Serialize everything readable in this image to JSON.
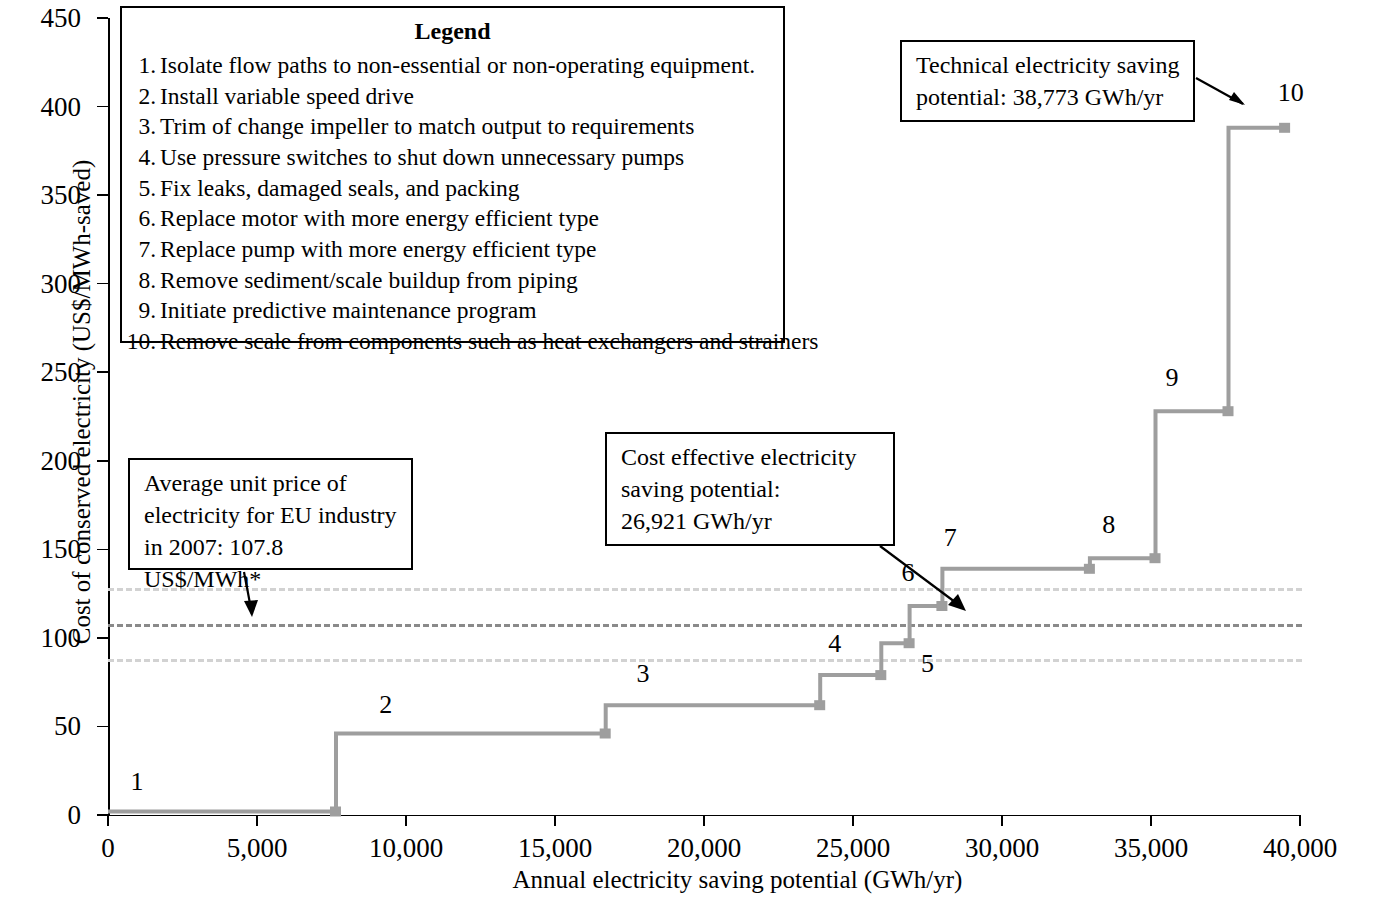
{
  "chart_data": {
    "type": "line",
    "title": "",
    "xlabel": "Annual electricity saving potential (GWh/yr)",
    "ylabel": "Cost of conserved electricity (US$/MWh-saved)",
    "xlim": [
      0,
      40000
    ],
    "ylim": [
      0,
      450
    ],
    "xticks": [
      "0",
      "5,000",
      "10,000",
      "15,000",
      "20,000",
      "25,000",
      "30,000",
      "35,000",
      "40,000"
    ],
    "xtick_values": [
      0,
      5000,
      10000,
      15000,
      20000,
      25000,
      30000,
      35000,
      40000
    ],
    "yticks": [
      "0",
      "50",
      "100",
      "150",
      "200",
      "250",
      "300",
      "350",
      "400",
      "450"
    ],
    "ytick_values": [
      0,
      50,
      100,
      150,
      200,
      250,
      300,
      350,
      400,
      450
    ],
    "grid": false,
    "legend_position": "inside-top",
    "series_name": "Cost of conserved electricity supply curve",
    "series_color": "#9e9e9e",
    "steps": [
      {
        "id": 1,
        "x_start": 0,
        "x_end": 7650,
        "cost": 2,
        "label": "1"
      },
      {
        "id": 2,
        "x_start": 7650,
        "x_end": 16700,
        "cost": 46,
        "label": "2"
      },
      {
        "id": 3,
        "x_start": 16700,
        "x_end": 23900,
        "cost": 62,
        "label": "3"
      },
      {
        "id": 4,
        "x_start": 23900,
        "x_end": 25950,
        "cost": 79,
        "label": "4"
      },
      {
        "id": 5,
        "x_start": 25950,
        "x_end": 26900,
        "cost": 97,
        "label": "5"
      },
      {
        "id": 6,
        "x_start": 26900,
        "x_end": 28000,
        "cost": 118,
        "label": "6"
      },
      {
        "id": 7,
        "x_start": 28000,
        "x_end": 32950,
        "cost": 139,
        "label": "7"
      },
      {
        "id": 8,
        "x_start": 32950,
        "x_end": 35150,
        "cost": 145,
        "label": "8"
      },
      {
        "id": 9,
        "x_start": 35150,
        "x_end": 37600,
        "cost": 228,
        "label": "9"
      },
      {
        "id": 10,
        "x_start": 37600,
        "x_end": 39500,
        "cost": 388,
        "label": "10"
      }
    ],
    "reference_lines": [
      {
        "name": "upper-band",
        "value": 128,
        "style": "dashed",
        "color": "#d2d2d2"
      },
      {
        "name": "average-unit-price",
        "value": 107.8,
        "style": "dashed",
        "color": "#8a8a8a"
      },
      {
        "name": "lower-band",
        "value": 88,
        "style": "dashed",
        "color": "#d2d2d2"
      }
    ],
    "annotations": [
      {
        "name": "technical-potential",
        "text": "Technical electricity saving potential: 38,773 GWh/yr",
        "value": 38773,
        "unit": "GWh/yr"
      },
      {
        "name": "cost-effective-potential",
        "text": "Cost effective electricity saving potential: 26,921 GWh/yr",
        "value": 26921,
        "unit": "GWh/yr"
      },
      {
        "name": "average-price",
        "text": "Average unit price of electricity for EU industry in 2007: 107.8 US$/MWh*",
        "value": 107.8,
        "unit": "US$/MWh"
      }
    ]
  },
  "axes": {
    "y_title": "Cost of conserved electricity (US$/MWh-saved)",
    "x_title": "Annual electricity saving potential (GWh/yr)",
    "y_ticks": [
      "450",
      "400",
      "350",
      "300",
      "250",
      "200",
      "150",
      "100",
      "50",
      "0"
    ],
    "x_ticks": [
      "0",
      "5,000",
      "10,000",
      "15,000",
      "20,000",
      "25,000",
      "30,000",
      "35,000",
      "40,000"
    ]
  },
  "legend": {
    "title": "Legend",
    "items": [
      {
        "num": "1.",
        "text": "Isolate flow paths to non-essential or non-operating equipment."
      },
      {
        "num": "2.",
        "text": "Install variable speed drive"
      },
      {
        "num": "3.",
        "text": "Trim of change impeller to match output to requirements"
      },
      {
        "num": "4.",
        "text": "Use pressure switches to shut down unnecessary pumps"
      },
      {
        "num": "5.",
        "text": "Fix leaks, damaged seals, and packing"
      },
      {
        "num": "6.",
        "text": "Replace motor with more energy efficient type"
      },
      {
        "num": "7.",
        "text": "Replace pump with more energy efficient type"
      },
      {
        "num": "8.",
        "text": "Remove sediment/scale buildup from piping"
      },
      {
        "num": "9.",
        "text": "Initiate predictive maintenance program"
      },
      {
        "num": "10.",
        "text": "Remove scale from components such as heat exchangers and strainers"
      }
    ]
  },
  "callouts": {
    "technical": {
      "line1": "Technical electricity  saving",
      "line2": "potential: 38,773 GWh/yr"
    },
    "cost_effective": {
      "line1": "Cost effective  electricity",
      "line2": "saving potential:",
      "line3": "26,921 GWh/yr"
    },
    "average_price": {
      "line1": "Average unit price of",
      "line2": "electricity for EU industry",
      "line3": "in 2007: 107.8 US$/MWh*"
    }
  },
  "point_labels": [
    "1",
    "2",
    "3",
    "4",
    "5",
    "6",
    "7",
    "8",
    "9",
    "10"
  ]
}
